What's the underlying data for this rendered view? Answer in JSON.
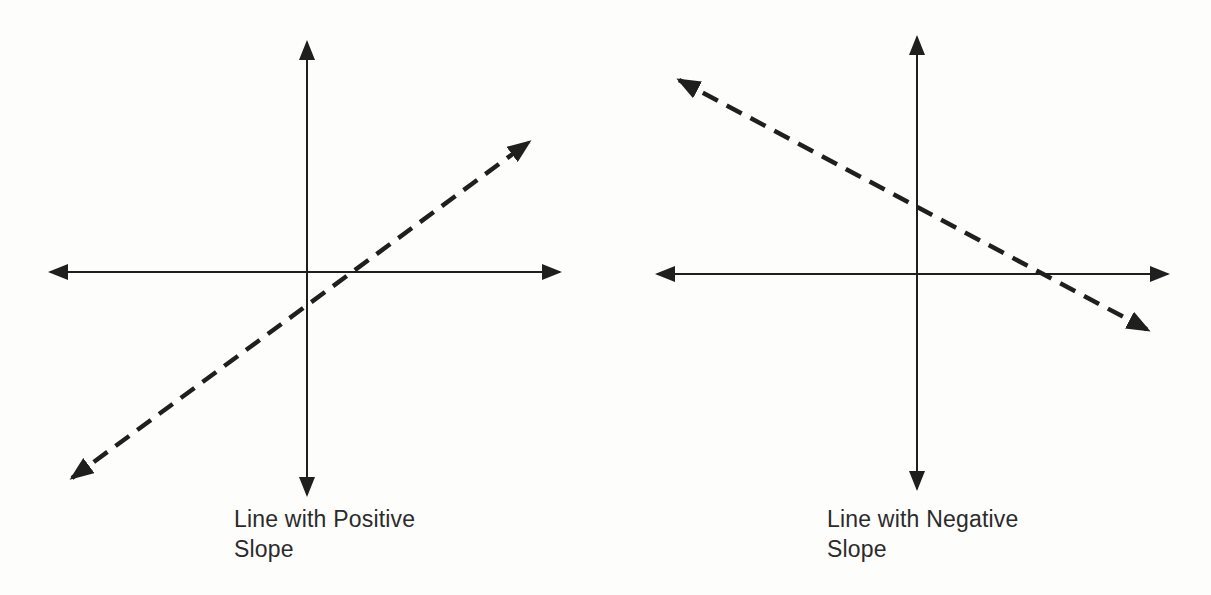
{
  "ink": "#1f1f1f",
  "background": "#fdfdfb",
  "figures": [
    {
      "slope": "positive",
      "line_style": "dashed",
      "caption_lines": [
        "Line with Positive",
        "Slope"
      ]
    },
    {
      "slope": "negative",
      "line_style": "dashed",
      "caption_lines": [
        "Line with Negative",
        "Slope"
      ]
    }
  ]
}
